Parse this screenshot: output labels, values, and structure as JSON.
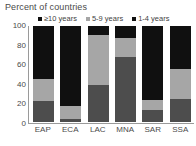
{
  "chart_data": {
    "type": "bar",
    "subtype": "stacked-column-100",
    "title": "Percent of countries",
    "xlabel": "",
    "ylabel": "",
    "ylim": [
      0,
      100
    ],
    "yticks": [
      100,
      80,
      60,
      40,
      20,
      0
    ],
    "grid": false,
    "legend_position": "top",
    "categories": [
      "EAP",
      "ECA",
      "LAC",
      "MNA",
      "SAR",
      "SSA"
    ],
    "series": [
      {
        "name": "1-4 years",
        "color": "#4d4d4d",
        "values": [
          22,
          3,
          39,
          68,
          12,
          24
        ]
      },
      {
        "name": "5-9 years",
        "color": "#a6a6a6",
        "values": [
          23,
          14,
          52,
          19,
          11,
          31
        ]
      },
      {
        "name": "≥10 years",
        "color": "#101010",
        "values": [
          55,
          83,
          9,
          13,
          77,
          45
        ]
      }
    ],
    "legend_entries": [
      {
        "label": "≥10 years",
        "color": "#101010"
      },
      {
        "label": "5-9 years",
        "color": "#a6a6a6"
      },
      {
        "label": "1-4 years",
        "color": "#101010"
      }
    ],
    "axis_color": "#9a9a9a",
    "text_color": "#4a4a4a",
    "background": "#ffffff"
  }
}
